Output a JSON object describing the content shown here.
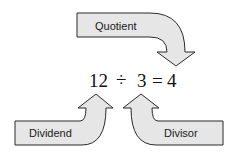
{
  "diagram": {
    "equation": {
      "dividend": "12",
      "operator": "÷",
      "divisor": "3",
      "equals": "=",
      "quotient": "4",
      "full_text": "12 ÷ 3 = 4"
    },
    "labels": {
      "quotient": "Quotient",
      "dividend": "Dividend",
      "divisor": "Divisor"
    },
    "colors": {
      "arrow_fill": "#e6e6e6",
      "arrow_stroke": "#2a2a2a",
      "text": "#111111"
    }
  }
}
